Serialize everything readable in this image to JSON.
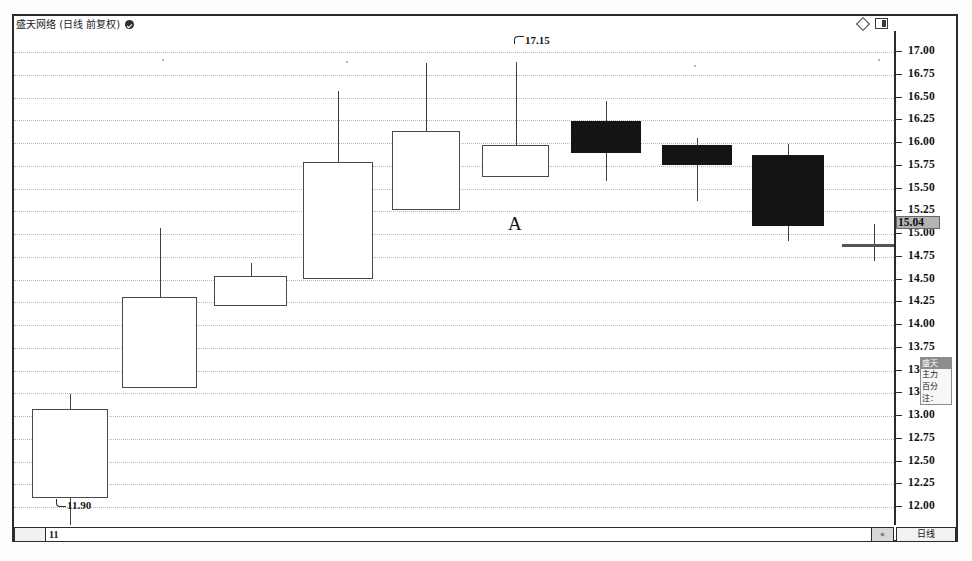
{
  "window": {
    "title": "盛天网络 (日线 前复权)",
    "verified_badge": "checkmark-badge",
    "icons": [
      "diamond-icon",
      "panel-toggle-icon"
    ]
  },
  "status_bar": {
    "code_field_value": "11",
    "nav_label": "«",
    "period_label": "日线"
  },
  "price_axis": {
    "last_price": "15.04",
    "ticks": [
      {
        "label": "17.00",
        "value": 17.0
      },
      {
        "label": "16.75",
        "value": 16.75
      },
      {
        "label": "16.50",
        "value": 16.5
      },
      {
        "label": "16.25",
        "value": 16.25
      },
      {
        "label": "16.00",
        "value": 16.0
      },
      {
        "label": "15.75",
        "value": 15.75
      },
      {
        "label": "15.50",
        "value": 15.5
      },
      {
        "label": "15.25",
        "value": 15.25
      },
      {
        "label": "15.00",
        "value": 15.0
      },
      {
        "label": "14.75",
        "value": 14.75
      },
      {
        "label": "14.50",
        "value": 14.5
      },
      {
        "label": "14.25",
        "value": 14.25
      },
      {
        "label": "14.00",
        "value": 14.0
      },
      {
        "label": "13.75",
        "value": 13.75
      },
      {
        "label": "13.50",
        "value": 13.5
      },
      {
        "label": "13.25",
        "value": 13.25
      },
      {
        "label": "13.00",
        "value": 13.0
      },
      {
        "label": "12.75",
        "value": 12.75
      },
      {
        "label": "12.50",
        "value": 12.5
      },
      {
        "label": "12.25",
        "value": 12.25
      },
      {
        "label": "12.00",
        "value": 12.0
      }
    ]
  },
  "axis_popup": {
    "head": "盛天",
    "line1": "主力",
    "line2": "百分",
    "line3": "注："
  },
  "annotations": [
    {
      "name": "high-callout",
      "text": "17.15",
      "value": 17.15
    },
    {
      "name": "low-callout",
      "text": "11.90",
      "value": 11.9
    },
    {
      "name": "region-label",
      "text": "A"
    }
  ],
  "chart_data": {
    "type": "candlestick",
    "title": "盛天网络 (日线 前复权)",
    "xlabel": "",
    "ylabel": "",
    "ylim": [
      11.85,
      17.25
    ],
    "grid": true,
    "legend": null,
    "y_ticks": [
      17.0,
      16.75,
      16.5,
      16.25,
      16.0,
      15.75,
      15.5,
      15.25,
      15.0,
      14.75,
      14.5,
      14.25,
      14.0,
      13.75,
      13.5,
      13.25,
      13.0,
      12.75,
      12.5,
      12.25,
      12.0
    ],
    "last_price": 15.04,
    "annotations": [
      {
        "text": "17.15",
        "price": 17.15,
        "note": "highest high of the swing"
      },
      {
        "text": "11.90",
        "price": 11.9,
        "note": "lowest low of the swing"
      },
      {
        "text": "A",
        "note": "pattern region label"
      }
    ],
    "series": [
      {
        "name": "OHLC",
        "candles": [
          {
            "index": 0,
            "open": 12.68,
            "high": 13.38,
            "low": 11.9,
            "close": 13.3,
            "direction": "up"
          },
          {
            "index": 1,
            "open": 13.56,
            "high": 14.7,
            "low": 13.56,
            "close": 14.38,
            "direction": "up"
          },
          {
            "index": 2,
            "open": 14.42,
            "high": 14.8,
            "low": 14.42,
            "close": 14.72,
            "direction": "up"
          },
          {
            "index": 3,
            "open": 14.78,
            "high": 16.38,
            "low": 14.78,
            "close": 15.9,
            "direction": "up"
          },
          {
            "index": 4,
            "open": 15.62,
            "high": 17.1,
            "low": 15.62,
            "close": 16.55,
            "direction": "up"
          },
          {
            "index": 5,
            "open": 16.05,
            "high": 17.15,
            "low": 16.05,
            "close": 16.4,
            "direction": "up"
          },
          {
            "index": 6,
            "open": 16.62,
            "high": 17.05,
            "low": 15.82,
            "close": 16.3,
            "direction": "down"
          },
          {
            "index": 7,
            "open": 16.32,
            "high": 16.62,
            "low": 15.5,
            "close": 16.18,
            "direction": "down"
          },
          {
            "index": 8,
            "open": 16.12,
            "high": 16.42,
            "low": 15.32,
            "close": 15.42,
            "direction": "down"
          },
          {
            "index": 9,
            "open": 15.23,
            "high": 15.52,
            "low": 14.95,
            "close": 15.23,
            "direction": "doji"
          }
        ]
      }
    ]
  },
  "geometry": {
    "plot": {
      "left": 14,
      "top": 31,
      "width": 880,
      "height": 494
    },
    "price_to_y": {
      "ref_price": 17.0,
      "ref_y": 21,
      "px_per_unit": 91.0
    },
    "candles_px": [
      {
        "x": 18,
        "w": 76,
        "body_top": 378,
        "body_bot": 467,
        "wick_top": 363,
        "wick_bot": 508,
        "dir": "up"
      },
      {
        "x": 108,
        "w": 75,
        "body_top": 266,
        "body_bot": 357,
        "wick_top": 197,
        "wick_bot": 357,
        "dir": "up"
      },
      {
        "x": 200,
        "w": 73,
        "body_top": 245,
        "body_bot": 275,
        "wick_top": 232,
        "wick_bot": 275,
        "dir": "up"
      },
      {
        "x": 289,
        "w": 70,
        "body_top": 131,
        "body_bot": 248,
        "wick_top": 60,
        "wick_bot": 248,
        "dir": "up"
      },
      {
        "x": 378,
        "w": 68,
        "body_top": 100,
        "body_bot": 179,
        "wick_top": 32,
        "wick_bot": 179,
        "dir": "up"
      },
      {
        "x": 468,
        "w": 67,
        "body_top": 114,
        "body_bot": 146,
        "wick_top": 31,
        "wick_bot": 146,
        "dir": "up"
      },
      {
        "x": 557,
        "w": 70,
        "body_top": 90,
        "body_bot": 122,
        "wick_top": 70,
        "wick_bot": 150,
        "dir": "down"
      },
      {
        "x": 648,
        "w": 70,
        "body_top": 114,
        "body_bot": 134,
        "wick_top": 107,
        "wick_bot": 170,
        "dir": "down"
      },
      {
        "x": 738,
        "w": 72,
        "body_top": 124,
        "body_bot": 195,
        "wick_top": 113,
        "wick_bot": 210,
        "dir": "down"
      },
      {
        "x": 828,
        "w": 64,
        "body_top": 213,
        "body_bot": 216,
        "wick_top": 193,
        "wick_bot": 230,
        "dir": "doji"
      }
    ]
  },
  "speckles": [
    {
      "x": 148,
      "y": 28
    },
    {
      "x": 332,
      "y": 30
    },
    {
      "x": 680,
      "y": 34
    },
    {
      "x": 864,
      "y": 28
    }
  ]
}
